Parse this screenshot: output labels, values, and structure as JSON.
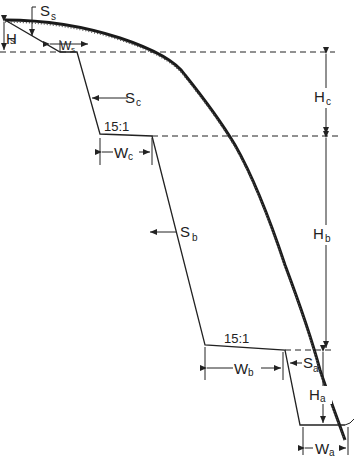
{
  "diagram": {
    "type": "slope cross-section with benches",
    "colors": {
      "line": "#222222",
      "ground": "#1a1a1a",
      "background": "#ffffff"
    },
    "labels": {
      "Ss": {
        "main": "S",
        "sub": "s"
      },
      "Hs": {
        "main": "H",
        "sub": "s"
      },
      "Ws": {
        "main": "W",
        "sub": "s"
      },
      "Sc": {
        "main": "S",
        "sub": "c"
      },
      "Hc": {
        "main": "H",
        "sub": "c"
      },
      "Wc": {
        "main": "W",
        "sub": "c"
      },
      "Sb": {
        "main": "S",
        "sub": "b"
      },
      "Hb": {
        "main": "H",
        "sub": "b"
      },
      "Wb": {
        "main": "W",
        "sub": "b"
      },
      "Sa": {
        "main": "S",
        "sub": "a"
      },
      "Ha": {
        "main": "H",
        "sub": "a"
      },
      "Wa": {
        "main": "W",
        "sub": "a"
      }
    },
    "bench_slopes": [
      {
        "id": "bench-c",
        "text": "15:1"
      },
      {
        "id": "bench-b",
        "text": "15:1"
      }
    ]
  }
}
